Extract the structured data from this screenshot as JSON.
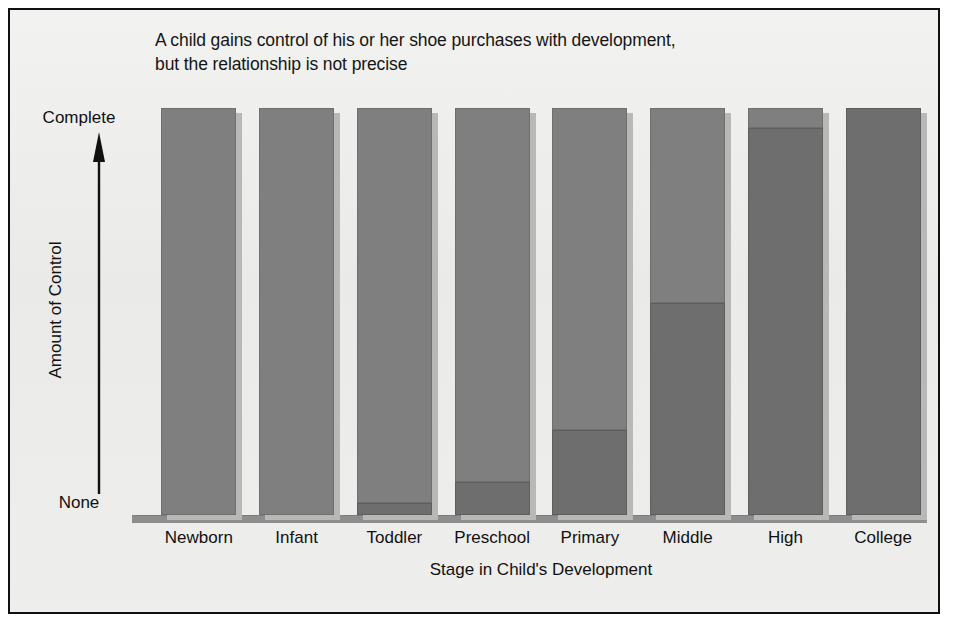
{
  "figure": {
    "title_lines": [
      "A child gains control of his or her shoe purchases with development,",
      "but the relationship is not precise"
    ]
  },
  "axes": {
    "y_top_label": "Complete",
    "y_bottom_label": "None",
    "y_axis_title": "Amount of Control",
    "x_axis_title": "Stage in Child's Development"
  },
  "colors": {
    "paper": "#ececeb",
    "frame": "#111111",
    "bar_upper": "#7f7f7f",
    "bar_lower": "#6e6e6e",
    "bar_shadow": "#b8b8b6",
    "baseline": "#8e8e8e",
    "text": "#111111"
  },
  "chart_data": {
    "type": "bar",
    "subtype": "stacked-bar",
    "title": "A child gains control of his or her shoe purchases with development, but the relationship is not precise",
    "xlabel": "Stage in Child's Development",
    "ylabel": "Amount of Control",
    "ylim": [
      0,
      100
    ],
    "ytick_labels": [
      "None",
      "Complete"
    ],
    "ytick_values": [
      0,
      100
    ],
    "grid": false,
    "legend": "none",
    "categories": [
      "Newborn",
      "Infant",
      "Toddler",
      "Preschool",
      "Primary",
      "Middle",
      "High",
      "College"
    ],
    "series": [
      {
        "name": "Child's control",
        "segment": "lower",
        "values": [
          0,
          0,
          3,
          8,
          21,
          52,
          95,
          100
        ]
      },
      {
        "name": "Parent's control",
        "segment": "upper",
        "values": [
          100,
          100,
          97,
          92,
          79,
          48,
          5,
          0
        ]
      }
    ]
  }
}
